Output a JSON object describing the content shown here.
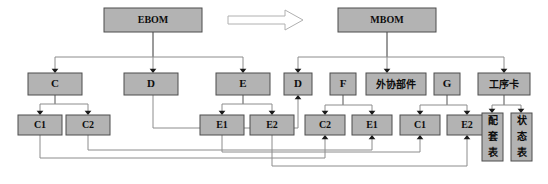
{
  "diagram": {
    "colors": {
      "node_fill": "#b3b3b3",
      "node_stroke": "#4d4d4d",
      "edge": "#8c8c8c",
      "arrowhead": "#1a1a1a",
      "background": "#ffffff",
      "big_arrow_fill": "#ffffff",
      "big_arrow_stroke": "#b0b0b0"
    },
    "nodes": [
      {
        "id": "ebom",
        "label": "EBOM",
        "x": 104,
        "y": 8,
        "w": 98,
        "h": 24,
        "font": 10,
        "cjk": false,
        "vertical": false
      },
      {
        "id": "mbom",
        "label": "MBOM",
        "x": 338,
        "y": 8,
        "w": 98,
        "h": 24,
        "font": 10,
        "cjk": false,
        "vertical": false
      },
      {
        "id": "e_c",
        "label": "C",
        "x": 28,
        "y": 73,
        "w": 54,
        "h": 22,
        "font": 11,
        "cjk": false,
        "vertical": false
      },
      {
        "id": "e_d",
        "label": "D",
        "x": 124,
        "y": 73,
        "w": 54,
        "h": 22,
        "font": 11,
        "cjk": false,
        "vertical": false
      },
      {
        "id": "e_e",
        "label": "E",
        "x": 216,
        "y": 73,
        "w": 54,
        "h": 22,
        "font": 11,
        "cjk": false,
        "vertical": false
      },
      {
        "id": "m_d",
        "label": "D",
        "x": 284,
        "y": 73,
        "w": 28,
        "h": 22,
        "font": 11,
        "cjk": false,
        "vertical": false
      },
      {
        "id": "m_f",
        "label": "F",
        "x": 330,
        "y": 73,
        "w": 26,
        "h": 22,
        "font": 11,
        "cjk": false,
        "vertical": false
      },
      {
        "id": "m_wx",
        "label": "外协部件",
        "x": 366,
        "y": 73,
        "w": 60,
        "h": 22,
        "font": 10,
        "cjk": true,
        "vertical": false
      },
      {
        "id": "m_g",
        "label": "G",
        "x": 434,
        "y": 73,
        "w": 26,
        "h": 22,
        "font": 11,
        "cjk": false,
        "vertical": false
      },
      {
        "id": "m_gxk",
        "label": "工序卡",
        "x": 478,
        "y": 73,
        "w": 52,
        "h": 22,
        "font": 10,
        "cjk": true,
        "vertical": false
      },
      {
        "id": "e_c1",
        "label": "C1",
        "x": 18,
        "y": 115,
        "w": 44,
        "h": 20,
        "font": 10,
        "cjk": false,
        "vertical": false
      },
      {
        "id": "e_c2",
        "label": "C2",
        "x": 66,
        "y": 115,
        "w": 44,
        "h": 20,
        "font": 10,
        "cjk": false,
        "vertical": false
      },
      {
        "id": "e_e1",
        "label": "E1",
        "x": 200,
        "y": 115,
        "w": 44,
        "h": 20,
        "font": 10,
        "cjk": false,
        "vertical": false
      },
      {
        "id": "e_e2",
        "label": "E2",
        "x": 250,
        "y": 115,
        "w": 44,
        "h": 20,
        "font": 10,
        "cjk": false,
        "vertical": false
      },
      {
        "id": "m_c2",
        "label": "C2",
        "x": 305,
        "y": 115,
        "w": 40,
        "h": 20,
        "font": 10,
        "cjk": false,
        "vertical": false
      },
      {
        "id": "m_e1",
        "label": "E1",
        "x": 352,
        "y": 115,
        "w": 40,
        "h": 20,
        "font": 10,
        "cjk": false,
        "vertical": false
      },
      {
        "id": "m_c1",
        "label": "C1",
        "x": 400,
        "y": 115,
        "w": 40,
        "h": 20,
        "font": 10,
        "cjk": false,
        "vertical": false
      },
      {
        "id": "m_e2",
        "label": "E2",
        "x": 447,
        "y": 115,
        "w": 40,
        "h": 20,
        "font": 10,
        "cjk": false,
        "vertical": false
      },
      {
        "id": "m_ptb",
        "label": "配套表",
        "x": 482,
        "y": 113,
        "w": 21,
        "h": 48,
        "font": 10,
        "cjk": true,
        "vertical": true
      },
      {
        "id": "m_ztb",
        "label": "状态表",
        "x": 511,
        "y": 113,
        "w": 21,
        "h": 48,
        "font": 10,
        "cjk": true,
        "vertical": true
      }
    ],
    "big_arrow": {
      "name": "transform-arrow",
      "points": "228,16 285,16 285,10 303,20 285,30 285,24 228,24"
    },
    "edges": [
      {
        "name": "edge-ebom-c",
        "d": "M153,32 L153,57 L55,57 L55,70",
        "arrow": {
          "x": 55,
          "y": 73,
          "dir": "down"
        }
      },
      {
        "name": "edge-ebom-d",
        "d": "M153,32 L153,70",
        "arrow": {
          "x": 153,
          "y": 73,
          "dir": "down"
        }
      },
      {
        "name": "edge-ebom-e",
        "d": "M153,32 L153,57 L243,57 L243,70",
        "arrow": {
          "x": 243,
          "y": 73,
          "dir": "down"
        }
      },
      {
        "name": "edge-mbom-d",
        "d": "M387,32 L387,57 L298,57 L298,70",
        "arrow": {
          "x": 298,
          "y": 73,
          "dir": "down"
        }
      },
      {
        "name": "edge-mbom-wx",
        "d": "M387,32 L387,70",
        "arrow": {
          "x": 387,
          "y": 73,
          "dir": "down"
        }
      },
      {
        "name": "edge-mbom-gxk",
        "d": "M387,32 L387,57 L504,57 L504,70",
        "arrow": {
          "x": 504,
          "y": 73,
          "dir": "down"
        }
      },
      {
        "name": "edge-c-c1",
        "d": "M55,95 L55,104 L40,104 L40,112",
        "arrow": {
          "x": 40,
          "y": 115,
          "dir": "down"
        }
      },
      {
        "name": "edge-c-c2",
        "d": "M55,95 L55,104 L88,104 L88,112",
        "arrow": {
          "x": 88,
          "y": 115,
          "dir": "down"
        }
      },
      {
        "name": "edge-e-e1",
        "d": "M243,95 L243,104 L222,104 L222,112",
        "arrow": {
          "x": 222,
          "y": 115,
          "dir": "down"
        }
      },
      {
        "name": "edge-e-e2",
        "d": "M243,95 L243,104 L272,104 L272,112",
        "arrow": {
          "x": 272,
          "y": 115,
          "dir": "down"
        }
      },
      {
        "name": "edge-f-c2",
        "d": "M343,95 L343,105 L325,105 L325,112",
        "arrow": {
          "x": 325,
          "y": 115,
          "dir": "down"
        }
      },
      {
        "name": "edge-f-e1",
        "d": "M343,95 L343,105 L372,105 L372,112",
        "arrow": {
          "x": 372,
          "y": 115,
          "dir": "down"
        }
      },
      {
        "name": "edge-g-c1",
        "d": "M447,95 L447,105 L420,105 L420,112",
        "arrow": {
          "x": 420,
          "y": 115,
          "dir": "down"
        }
      },
      {
        "name": "edge-g-e2",
        "d": "M447,95 L447,105 L467,105 L467,112",
        "arrow": {
          "x": 467,
          "y": 115,
          "dir": "down"
        }
      },
      {
        "name": "edge-gxk-ptb",
        "d": "M504,95 L504,105 L492,105 L492,110",
        "arrow": {
          "x": 492,
          "y": 113,
          "dir": "down"
        }
      },
      {
        "name": "edge-gxk-ztb",
        "d": "M504,95 L504,105 L521,105 L521,110",
        "arrow": {
          "x": 521,
          "y": 113,
          "dir": "down"
        }
      },
      {
        "name": "edge-ed-md",
        "d": "M153,95 L153,128 L298,128 L298,98",
        "arrow": {
          "x": 298,
          "y": 95,
          "dir": "up"
        }
      },
      {
        "name": "edge-ec1-mc2",
        "d": "M40,135 L40,158 L325,158 L325,138",
        "arrow": {
          "x": 325,
          "y": 135,
          "dir": "up"
        }
      },
      {
        "name": "edge-ec2-me1",
        "d": "M88,135 L88,150 L372,150 L372,138",
        "arrow": {
          "x": 372,
          "y": 135,
          "dir": "up"
        }
      },
      {
        "name": "edge-ee1-mc1",
        "d": "M222,135 L222,152 L420,152 L420,138",
        "arrow": {
          "x": 420,
          "y": 135,
          "dir": "up"
        }
      },
      {
        "name": "edge-ee2-me2",
        "d": "M272,135 L272,166 L467,166 L467,138",
        "arrow": {
          "x": 467,
          "y": 135,
          "dir": "up"
        }
      }
    ]
  }
}
